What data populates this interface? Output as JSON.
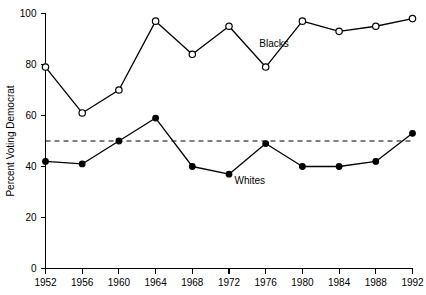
{
  "chart_data": {
    "type": "line",
    "title": "",
    "xlabel": "",
    "ylabel": "Percent Voting Democrat",
    "x": [
      1952,
      1956,
      1960,
      1964,
      1968,
      1972,
      1976,
      1980,
      1984,
      1988,
      1992
    ],
    "xlim": [
      1952,
      1992
    ],
    "ylim": [
      0,
      100
    ],
    "xticks": [
      "1952",
      "1956",
      "1960",
      "1964",
      "1968",
      "1972",
      "1976",
      "1980",
      "1984",
      "1988",
      "1992"
    ],
    "yticks": [
      "0",
      "20",
      "40",
      "60",
      "80",
      "100"
    ],
    "ytick_values": [
      0,
      20,
      40,
      60,
      80,
      100
    ],
    "grid": false,
    "legend_position": "inline-annotation",
    "series": [
      {
        "name": "Blacks",
        "marker": "open-circle",
        "values": [
          79,
          61,
          70,
          97,
          84,
          95,
          79,
          97,
          93,
          95,
          98
        ],
        "label_text": "Blacks"
      },
      {
        "name": "Whites",
        "marker": "filled-circle",
        "values": [
          42,
          41,
          50,
          59,
          40,
          37,
          49,
          40,
          40,
          42,
          53
        ],
        "label_text": "Whites"
      }
    ],
    "reference_line": {
      "name": "fifty-percent-line",
      "value": 50,
      "style": "dashed"
    },
    "annotations": [
      {
        "text": "Blacks",
        "x": 1975.3,
        "y": 87
      },
      {
        "text": "Whites",
        "x": 1972.6,
        "y": 33
      }
    ],
    "colors": {
      "line": "#000000",
      "marker_open_fill": "#ffffff",
      "marker_filled_fill": "#000000",
      "axis": "#000000",
      "background": "#ffffff"
    }
  }
}
